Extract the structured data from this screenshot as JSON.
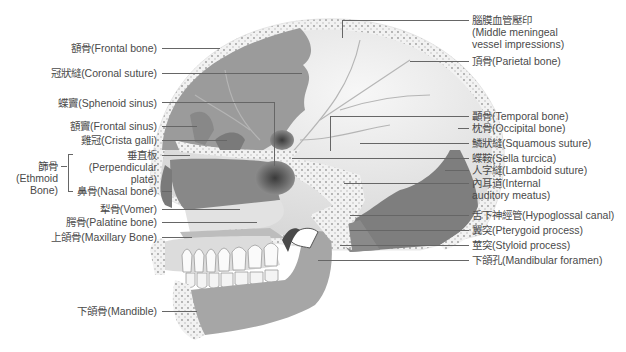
{
  "diagram": {
    "type": "anatomy-skull-sagittal",
    "colors": {
      "background": "#ffffff",
      "bone_light": "#ececec",
      "bone_mid": "#bdbdbd",
      "bone_dark": "#8e8e8e",
      "bone_darker": "#6f6f6f",
      "dots": "#9a9a9a",
      "leader_line": "#666666",
      "label_text": "#4a4a4a"
    }
  },
  "labels_left": [
    {
      "id": "frontal-bone",
      "text": "額骨(Frontal bone)"
    },
    {
      "id": "coronal-suture",
      "text": "冠狀縫(Coronal suture)"
    },
    {
      "id": "sphenoid-sinus",
      "text": "蝶竇(Sphenoid sinus)"
    },
    {
      "id": "frontal-sinus",
      "text": "額竇(Frontal sinus)"
    },
    {
      "id": "crista-galli",
      "text": "雞冠(Crista galli)"
    },
    {
      "id": "perpendicular-plate",
      "text_zh": "垂直板",
      "text_en1": "(Perpendicular",
      "text_en2": "plate)"
    },
    {
      "id": "nasal-bone",
      "text": "鼻骨(Nasal bone)"
    },
    {
      "id": "vomer",
      "text": "犁骨(Vomer)"
    },
    {
      "id": "palatine-bone",
      "text": "腭骨(Palatine bone)"
    },
    {
      "id": "maxillary-bone",
      "text": "上頜骨(Maxillary Bone)"
    },
    {
      "id": "mandible",
      "text": "下頜骨(Mandible)"
    }
  ],
  "ethmoid_group": {
    "zh": "篩骨",
    "en1": "(Ethmoid",
    "en2": "Bone)"
  },
  "labels_right": [
    {
      "id": "middle-meningeal",
      "text_zh": "腦膜血管壓印",
      "text_en1": "(Middle meningeal",
      "text_en2": "vessel impressions)"
    },
    {
      "id": "parietal-bone",
      "text": "頂骨(Parietal bone)"
    },
    {
      "id": "temporal-bone",
      "text": "顳骨(Temporal bone)"
    },
    {
      "id": "occipital-bone",
      "text": "枕骨(Occipital bone)"
    },
    {
      "id": "squamous-suture",
      "text": "鱗狀縫(Squamous suture)"
    },
    {
      "id": "sella-turcica",
      "text": "蝶鞍(Sella turcica)"
    },
    {
      "id": "lambdoid-suture",
      "text": "人字縫(Lambdoid suture)"
    },
    {
      "id": "internal-auditory-meatus",
      "text_zh": "內耳道(Internal",
      "text_en": "auditory meatus)"
    },
    {
      "id": "hypoglossal-canal",
      "text": "舌下神經管(Hypoglossal canal)"
    },
    {
      "id": "pterygoid-process",
      "text": "翼突(Pterygoid process)"
    },
    {
      "id": "styloid-process",
      "text": "莖突(Styloid process)"
    },
    {
      "id": "mandibular-foramen",
      "text": "下頜孔(Mandibular foramen)"
    }
  ]
}
